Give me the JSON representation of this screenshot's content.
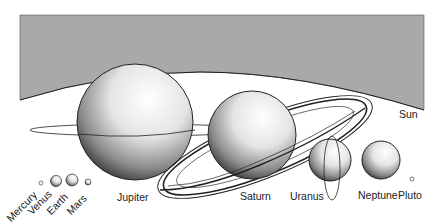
{
  "diagram": {
    "colors": {
      "sun_fill": "#a9a9a9",
      "background": "#ffffff",
      "outline": "#1a1a1a",
      "label": "#222222"
    },
    "sun": {
      "label": "Sun"
    },
    "planets": [
      {
        "name": "Mercury",
        "label": "Mercury"
      },
      {
        "name": "Venus",
        "label": "Venus"
      },
      {
        "name": "Earth",
        "label": "Earth"
      },
      {
        "name": "Mars",
        "label": "Mars"
      },
      {
        "name": "Jupiter",
        "label": "Jupiter"
      },
      {
        "name": "Saturn",
        "label": "Saturn"
      },
      {
        "name": "Uranus",
        "label": "Uranus"
      },
      {
        "name": "Neptune",
        "label": "Neptune"
      },
      {
        "name": "Pluto",
        "label": "Pluto"
      }
    ]
  }
}
